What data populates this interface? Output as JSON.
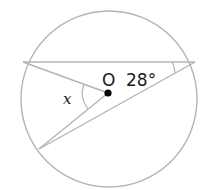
{
  "diagram": {
    "type": "circle-geometry",
    "center_label": "O",
    "given_angle": "28°",
    "unknown_angle": "x",
    "colors": {
      "stroke": "#b0b0b0",
      "text": "#1a1a1a",
      "dot": "#000000"
    }
  }
}
